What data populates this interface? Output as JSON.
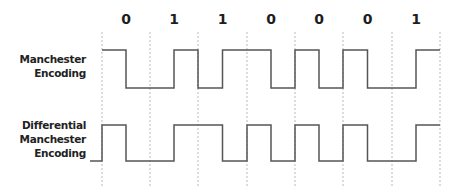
{
  "bits": [
    "0",
    "1",
    "1",
    "0",
    "0",
    "0",
    "1"
  ],
  "rows": [
    {
      "label_lines": [
        "Manchester",
        "Encoding"
      ]
    },
    {
      "label_lines": [
        "Differential",
        "Manchester",
        "Encoding"
      ]
    }
  ],
  "layout": {
    "grid_x": [
      102,
      150,
      198,
      247,
      295,
      343,
      392,
      440
    ],
    "manchester": {
      "high_y": 50,
      "low_y": 88
    },
    "differential": {
      "high_y": 125,
      "low_y": 161,
      "lead_in_x": 90
    }
  },
  "colors": {
    "wave": "#555555",
    "grid": "#b8b8b8",
    "text": "#1e1e1e"
  }
}
